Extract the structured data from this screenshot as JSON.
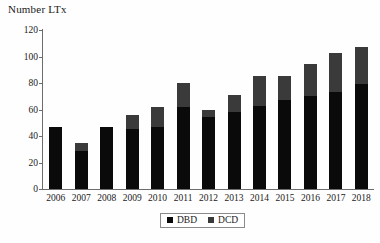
{
  "chart_data": {
    "type": "bar",
    "title": "Number LTx",
    "xlabel": "",
    "ylabel": "Number LTx",
    "ylim": [
      0,
      120
    ],
    "yticks": [
      0,
      20,
      40,
      60,
      80,
      100,
      120
    ],
    "grid": false,
    "stacked": true,
    "legend_position": "bottom",
    "categories": [
      "2006",
      "2007",
      "2008",
      "2009",
      "2010",
      "2011",
      "2012",
      "2013",
      "2014",
      "2015",
      "2016",
      "2017",
      "2018"
    ],
    "series": [
      {
        "name": "DBD",
        "color": "#0a0a0a",
        "values": [
          47,
          29,
          47,
          45,
          47,
          62,
          54,
          58,
          63,
          67,
          70,
          73,
          79
        ]
      },
      {
        "name": "DCD",
        "color": "#3a3a3a",
        "values": [
          0,
          6,
          0,
          11,
          15,
          18,
          6,
          13,
          22,
          18,
          24,
          30,
          28
        ]
      }
    ],
    "totals": [
      47,
      35,
      47,
      56,
      62,
      80,
      60,
      71,
      85,
      85,
      94,
      103,
      107
    ]
  },
  "legend": {
    "items": [
      {
        "label": "DBD",
        "swatch": "black-square-icon"
      },
      {
        "label": "DCD",
        "swatch": "gray-square-icon"
      }
    ]
  },
  "axis": {
    "y_tick_labels": [
      "120",
      "100",
      "80",
      "60",
      "40",
      "20",
      "0"
    ],
    "x_tick_labels": [
      "2006",
      "2007",
      "2008",
      "2009",
      "2010",
      "2011",
      "2012",
      "2013",
      "2014",
      "2015",
      "2016",
      "2017",
      "2018"
    ]
  }
}
